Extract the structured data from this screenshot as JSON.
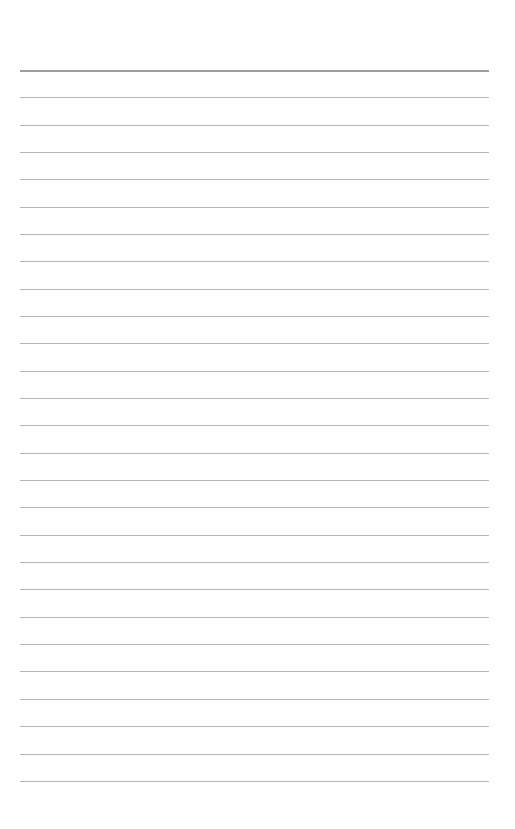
{
  "page": {
    "type": "lined-paper",
    "line_count": 27,
    "first_line_y": 70,
    "line_spacing": 27.34,
    "line_left": 20,
    "line_width": 469,
    "line_color": "#a9a9a9",
    "top_line_color": "#8c8c8c",
    "background": "#fefefe"
  }
}
